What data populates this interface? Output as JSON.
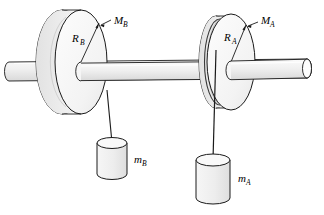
{
  "figure": {
    "background_color": "#ffffff",
    "stroke_color": "#1a1a1a",
    "fill_light": "#f2f2f2",
    "fill_rim": "#e6e6e6",
    "fill_shaft": "#ededed",
    "fill_mass": "#efefef",
    "fill_mass_top": "#f7f7f7"
  },
  "labels": {
    "radius_b": {
      "main": "R",
      "sub": "B",
      "text": "R_B"
    },
    "mass_disc_b": {
      "main": "M",
      "sub": "B",
      "text": "M_B"
    },
    "radius_a": {
      "main": "R",
      "sub": "A",
      "text": "R_A"
    },
    "mass_disc_a": {
      "main": "M",
      "sub": "A",
      "text": "M_A"
    },
    "hanging_mass_b": {
      "main": "m",
      "sub": "B",
      "text": "m_B"
    },
    "hanging_mass_a": {
      "main": "m",
      "sub": "A",
      "text": "m_A"
    }
  },
  "components": {
    "shaft": {
      "name": "axle-shaft"
    },
    "disc_b": {
      "name": "pulley-disc-b",
      "radius_label": "R_B",
      "mass_label": "M_B"
    },
    "disc_a": {
      "name": "pulley-disc-a",
      "radius_label": "R_A",
      "mass_label": "M_A"
    },
    "cord_b": {
      "name": "cord-b"
    },
    "cord_a": {
      "name": "cord-a"
    },
    "mass_b": {
      "name": "hanging-mass-b",
      "label": "m_B"
    },
    "mass_a": {
      "name": "hanging-mass-a",
      "label": "m_A"
    }
  }
}
